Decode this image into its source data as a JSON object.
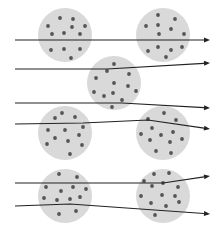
{
  "diagram": {
    "colors": {
      "background": "#ffffff",
      "cluster_fill": "#d9d9d9",
      "particle": "#555555",
      "ray": "#222222"
    },
    "clusters": [
      {
        "cx": 65,
        "cy": 35,
        "r": 27,
        "particles": [
          [
            60,
            18
          ],
          [
            73,
            19
          ],
          [
            48,
            26
          ],
          [
            72,
            27
          ],
          [
            85,
            26
          ],
          [
            52,
            34
          ],
          [
            64,
            33
          ],
          [
            80,
            34
          ],
          [
            51,
            50
          ],
          [
            64,
            49
          ],
          [
            80,
            49
          ],
          [
            71,
            58
          ]
        ]
      },
      {
        "cx": 163,
        "cy": 35,
        "r": 27,
        "particles": [
          [
            158,
            15
          ],
          [
            175,
            19
          ],
          [
            146,
            26
          ],
          [
            158,
            25
          ],
          [
            171,
            29
          ],
          [
            159,
            34
          ],
          [
            184,
            34
          ],
          [
            148,
            51
          ],
          [
            158,
            47
          ],
          [
            171,
            50
          ],
          [
            182,
            47
          ],
          [
            166,
            57
          ]
        ]
      },
      {
        "cx": 114,
        "cy": 83,
        "r": 27,
        "particles": [
          [
            114,
            64
          ],
          [
            107,
            71
          ],
          [
            129,
            74
          ],
          [
            96,
            78
          ],
          [
            114,
            83
          ],
          [
            128,
            86
          ],
          [
            94,
            92
          ],
          [
            104,
            96
          ],
          [
            113,
            93
          ],
          [
            136,
            91
          ],
          [
            122,
            100
          ],
          [
            112,
            107
          ]
        ]
      },
      {
        "cx": 65,
        "cy": 133,
        "r": 27,
        "particles": [
          [
            62,
            113
          ],
          [
            55,
            118
          ],
          [
            75,
            117
          ],
          [
            48,
            130
          ],
          [
            65,
            130
          ],
          [
            83,
            127
          ],
          [
            79,
            135
          ],
          [
            55,
            138
          ],
          [
            68,
            141
          ],
          [
            47,
            144
          ],
          [
            82,
            145
          ],
          [
            70,
            154
          ]
        ]
      },
      {
        "cx": 163,
        "cy": 133,
        "r": 27,
        "particles": [
          [
            164,
            113
          ],
          [
            148,
            119
          ],
          [
            176,
            120
          ],
          [
            152,
            128
          ],
          [
            173,
            132
          ],
          [
            141,
            134
          ],
          [
            161,
            135
          ],
          [
            150,
            140
          ],
          [
            170,
            142
          ],
          [
            182,
            139
          ],
          [
            156,
            151
          ],
          [
            171,
            153
          ]
        ]
      },
      {
        "cx": 65,
        "cy": 196,
        "r": 27,
        "particles": [
          [
            59,
            174
          ],
          [
            77,
            177
          ],
          [
            46,
            187
          ],
          [
            61,
            191
          ],
          [
            73,
            187
          ],
          [
            86,
            189
          ],
          [
            44,
            198
          ],
          [
            57,
            200
          ],
          [
            70,
            199
          ],
          [
            80,
            197
          ],
          [
            59,
            214
          ],
          [
            76,
            211
          ]
        ]
      },
      {
        "cx": 163,
        "cy": 196,
        "r": 27,
        "particles": [
          [
            154,
            174
          ],
          [
            169,
            173
          ],
          [
            144,
            181
          ],
          [
            163,
            183
          ],
          [
            178,
            187
          ],
          [
            152,
            186
          ],
          [
            141,
            196
          ],
          [
            162,
            195
          ],
          [
            175,
            196
          ],
          [
            151,
            203
          ],
          [
            166,
            206
          ],
          [
            179,
            202
          ],
          [
            155,
            215
          ]
        ]
      }
    ],
    "rays": [
      {
        "points": [
          [
            15,
            40
          ],
          [
            210,
            40
          ]
        ]
      },
      {
        "points": [
          [
            15,
            69
          ],
          [
            107,
            69
          ],
          [
            210,
            63
          ]
        ]
      },
      {
        "points": [
          [
            15,
            103
          ],
          [
            122,
            103
          ],
          [
            210,
            108
          ]
        ]
      },
      {
        "points": [
          [
            15,
            124
          ],
          [
            83,
            123
          ],
          [
            148,
            120
          ],
          [
            210,
            129
          ]
        ]
      },
      {
        "points": [
          [
            15,
            183
          ],
          [
            163,
            183
          ],
          [
            210,
            176
          ]
        ]
      },
      {
        "points": [
          [
            15,
            206
          ],
          [
            70,
            204
          ],
          [
            210,
            214
          ]
        ]
      }
    ]
  }
}
